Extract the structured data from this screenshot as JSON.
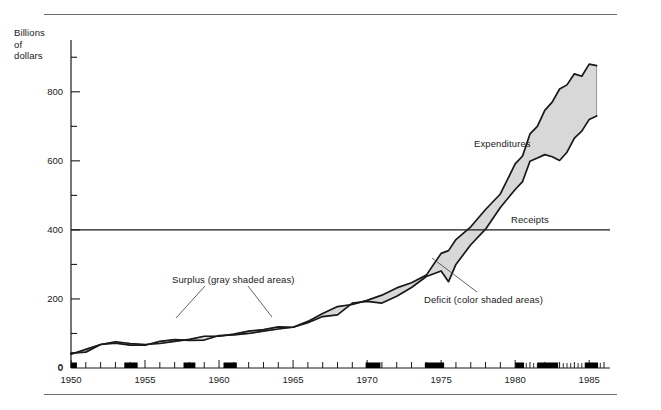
{
  "figure": {
    "axis_title": "Billions\nof\ndollars"
  },
  "annotations": {
    "surplus": "Surplus (gray shaded areas)",
    "deficit": "Deficit (color shaded areas)",
    "expenditures": "Expenditures",
    "receipts": "Receipts"
  },
  "colors": {
    "line": "#1a1a1a",
    "shade": "#d8d8d8",
    "shade_edge": "#8c8c8c",
    "rule": "#6d6d6d",
    "recession_bar": "#000000"
  },
  "chart_data": {
    "type": "area",
    "title": "",
    "subtitle": "",
    "xlabel": "",
    "ylabel": "Billions of dollars",
    "xlim": [
      1950,
      1986
    ],
    "ylim": [
      0,
      950
    ],
    "grid": false,
    "legend_position": "inline-annotations",
    "y_major_ticks": [
      0,
      200,
      400,
      600,
      800
    ],
    "y_minor_ticks": [
      100,
      300,
      500,
      700,
      900
    ],
    "y_tick_labels": [
      "0",
      "200",
      "400",
      "600",
      "800"
    ],
    "x_tick_labels": [
      "1950",
      "1955",
      "1960",
      "1965",
      "1970",
      "1975",
      "1980",
      "1985"
    ],
    "x_major_ticks": [
      1950,
      1955,
      1960,
      1965,
      1970,
      1975,
      1980,
      1985
    ],
    "gridline_at": 400,
    "recession_bands": [
      [
        1949.8,
        1950.4
      ],
      [
        1953.6,
        1954.5
      ],
      [
        1957.6,
        1958.4
      ],
      [
        1960.3,
        1961.2
      ],
      [
        1969.9,
        1970.9
      ],
      [
        1973.9,
        1975.2
      ],
      [
        1980.0,
        1980.6
      ],
      [
        1981.5,
        1982.9
      ],
      [
        1984.7,
        1985.6
      ]
    ],
    "x": [
      1950,
      1951,
      1952,
      1953,
      1954,
      1955,
      1956,
      1957,
      1958,
      1959,
      1960,
      1961,
      1962,
      1963,
      1964,
      1965,
      1966,
      1967,
      1968,
      1969,
      1970,
      1971,
      1972,
      1973,
      1974,
      1975,
      1975.5,
      1976,
      1977,
      1978,
      1979,
      1980,
      1980.5,
      1981,
      1981.5,
      1982,
      1982.5,
      1983,
      1983.5,
      1984,
      1984.5,
      1985,
      1985.5
    ],
    "series": [
      {
        "name": "Receipts",
        "values": [
          40,
          54,
          68,
          72,
          66,
          66,
          77,
          82,
          80,
          81,
          94,
          96,
          100,
          107,
          113,
          118,
          131,
          149,
          154,
          188,
          193,
          188,
          208,
          233,
          265,
          281,
          250,
          300,
          357,
          402,
          465,
          517,
          540,
          599,
          608,
          618,
          612,
          601,
          625,
          666,
          686,
          720,
          730
        ]
      },
      {
        "name": "Expenditures",
        "values": [
          43,
          46,
          68,
          76,
          71,
          68,
          71,
          77,
          83,
          92,
          92,
          98,
          107,
          111,
          119,
          118,
          135,
          158,
          178,
          184,
          196,
          211,
          232,
          247,
          269,
          332,
          340,
          372,
          409,
          459,
          504,
          591,
          614,
          678,
          700,
          746,
          770,
          808,
          820,
          852,
          845,
          880,
          876
        ]
      }
    ]
  }
}
